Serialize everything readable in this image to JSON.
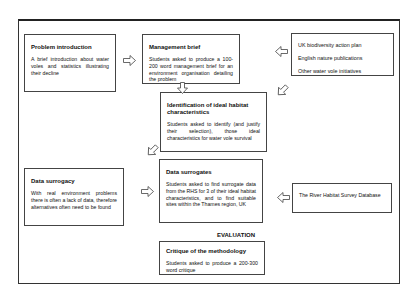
{
  "boxes": {
    "problem_intro": {
      "title": "Problem introduction",
      "desc": "A brief introduction about water voles and statistics illustrating their decline"
    },
    "management_brief": {
      "title": "Management brief",
      "desc": "Students asked to produce a 100-200 word management brief for an environment organisation detailing the problem"
    },
    "sources": {
      "items": [
        "UK biodiversity action plan",
        "English nature publications",
        "Other water vole initiatives"
      ]
    },
    "identification": {
      "title": "Identification of ideal habitat characteristics",
      "desc": "Students asked to identify (and justify their selection), those ideal characteristics for water vole survival"
    },
    "data_surrogacy": {
      "title": "Data surrogacy",
      "desc": "With real environment problems there is often a lack of data, therefore alternatives often need to be found"
    },
    "data_surrogates": {
      "title": "Data surrogates",
      "desc": "Students asked to find surrogate data from the RHS for 3 of their ideal habitat characteristics, and to find suitable sites within the Thames region, UK"
    },
    "rhs": {
      "desc": "The River Habitat Survey Database"
    },
    "critique": {
      "title": "Critique of the methodology",
      "desc": "Students asked to produce a 200-300 word critique"
    }
  },
  "evaluation_label": "EVALUATION"
}
